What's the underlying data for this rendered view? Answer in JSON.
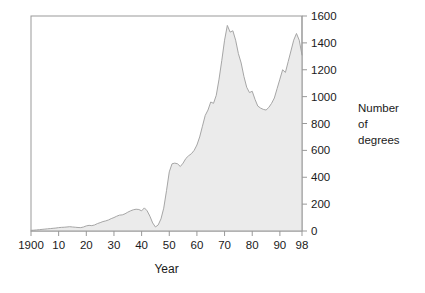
{
  "chart_data": {
    "type": "area",
    "title": "",
    "xlabel": "Year",
    "ylabel": "Number of degrees",
    "ylabel_lines": [
      "Number",
      "of",
      "degrees"
    ],
    "xlim": [
      1900,
      1998
    ],
    "ylim": [
      0,
      1600
    ],
    "grid": false,
    "legend": false,
    "x_tick_labels": [
      "1900",
      "10",
      "20",
      "30",
      "40",
      "50",
      "60",
      "70",
      "80",
      "90",
      "98"
    ],
    "x_tick_values": [
      1900,
      1910,
      1920,
      1930,
      1940,
      1950,
      1960,
      1970,
      1980,
      1990,
      1998
    ],
    "y_tick_labels": [
      "0",
      "200",
      "400",
      "600",
      "800",
      "1000",
      "1200",
      "1400",
      "1600"
    ],
    "y_tick_values": [
      0,
      200,
      400,
      600,
      800,
      1000,
      1200,
      1400,
      1600
    ],
    "y_axis_side": "right",
    "series_name": "Number of degrees",
    "fill_color": "#ebebeb",
    "line_color": "#a6a6a6",
    "axis_color": "#999999",
    "text_color": "#1a1a1a",
    "x": [
      1900,
      1901,
      1902,
      1903,
      1904,
      1905,
      1906,
      1907,
      1908,
      1909,
      1910,
      1911,
      1912,
      1913,
      1914,
      1915,
      1916,
      1917,
      1918,
      1919,
      1920,
      1921,
      1922,
      1923,
      1924,
      1925,
      1926,
      1927,
      1928,
      1929,
      1930,
      1931,
      1932,
      1933,
      1934,
      1935,
      1936,
      1937,
      1938,
      1939,
      1940,
      1941,
      1942,
      1943,
      1944,
      1945,
      1946,
      1947,
      1948,
      1949,
      1950,
      1951,
      1952,
      1953,
      1954,
      1955,
      1956,
      1957,
      1958,
      1959,
      1960,
      1961,
      1962,
      1963,
      1964,
      1965,
      1966,
      1967,
      1968,
      1969,
      1970,
      1971,
      1972,
      1973,
      1974,
      1975,
      1976,
      1977,
      1978,
      1979,
      1980,
      1981,
      1982,
      1983,
      1984,
      1985,
      1986,
      1987,
      1988,
      1989,
      1990,
      1991,
      1992,
      1993,
      1994,
      1995,
      1996,
      1997,
      1998
    ],
    "values": [
      5,
      6,
      8,
      10,
      12,
      14,
      16,
      18,
      20,
      22,
      25,
      27,
      28,
      30,
      32,
      30,
      28,
      26,
      25,
      30,
      38,
      42,
      40,
      45,
      55,
      62,
      70,
      75,
      82,
      92,
      100,
      110,
      118,
      120,
      128,
      140,
      150,
      158,
      162,
      160,
      150,
      172,
      150,
      110,
      60,
      30,
      45,
      90,
      170,
      300,
      440,
      500,
      505,
      500,
      480,
      505,
      540,
      560,
      575,
      600,
      640,
      700,
      780,
      860,
      900,
      960,
      950,
      1010,
      1130,
      1270,
      1420,
      1530,
      1480,
      1490,
      1420,
      1320,
      1250,
      1150,
      1070,
      1030,
      1040,
      980,
      930,
      915,
      905,
      900,
      920,
      950,
      990,
      1060,
      1130,
      1200,
      1180,
      1260,
      1340,
      1420,
      1470,
      1420,
      1310
    ]
  }
}
